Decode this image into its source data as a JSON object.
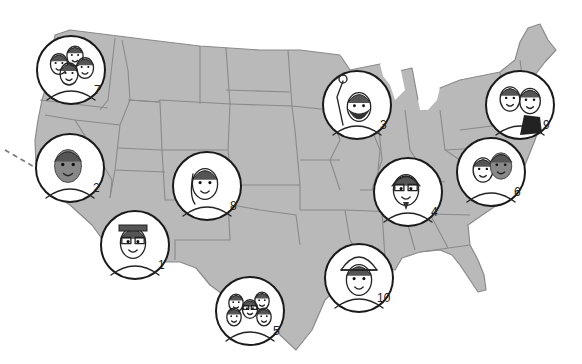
{
  "map": {
    "region": "United States (contiguous)",
    "land_color": "#b9b9b9",
    "border_color": "#8a8a8a",
    "background": "#ffffff"
  },
  "markers": [
    {
      "number": "1",
      "label": "1",
      "cx": 135,
      "cy": 245,
      "r": 34,
      "subject": "person-with-headband-and-glasses"
    },
    {
      "number": "2",
      "label": "2",
      "cx": 70,
      "cy": 168,
      "r": 34,
      "subject": "person-with-eyes-closed"
    },
    {
      "number": "3",
      "label": "3",
      "cx": 357,
      "cy": 105,
      "r": 34,
      "subject": "bearded-man-raising-fist"
    },
    {
      "number": "4",
      "label": "4",
      "cx": 408,
      "cy": 192,
      "r": 34,
      "subject": "man-with-glasses-and-headphones"
    },
    {
      "number": "5",
      "label": "5",
      "cx": 250,
      "cy": 311,
      "r": 34,
      "subject": "group-of-people"
    },
    {
      "number": "6",
      "label": "6",
      "cx": 491,
      "cy": 172,
      "r": 34,
      "subject": "two-people"
    },
    {
      "number": "7",
      "label": "7",
      "cx": 71,
      "cy": 70,
      "r": 34,
      "subject": "group-of-four-faces"
    },
    {
      "number": "8",
      "label": "8",
      "cx": 207,
      "cy": 186,
      "r": 34,
      "subject": "smiling-woman"
    },
    {
      "number": "9",
      "label": "9",
      "cx": 520,
      "cy": 105,
      "r": 34,
      "subject": "two-women"
    },
    {
      "number": "10",
      "label": "10",
      "cx": 359,
      "cy": 278,
      "r": 34,
      "subject": "person-in-knit-cap"
    }
  ]
}
